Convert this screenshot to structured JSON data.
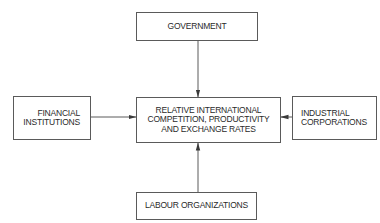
{
  "diagram": {
    "nodes": {
      "government": {
        "label": "GOVERNMENT"
      },
      "center": {
        "lines": [
          "RELATIVE INTERNATIONAL",
          "COMPETITION, PRODUCTIVITY",
          "AND EXCHANGE RATES"
        ]
      },
      "financial": {
        "lines": [
          "FINANCIAL",
          "INSTITUTIONS"
        ]
      },
      "industrial": {
        "lines": [
          "INDUSTRIAL",
          "CORPORATIONS"
        ]
      },
      "labour": {
        "label": "LABOUR ORGANIZATIONS"
      }
    },
    "edges": [
      {
        "from": "GOVERNMENT",
        "to": "RELATIVE INTERNATIONAL COMPETITION, PRODUCTIVITY AND EXCHANGE RATES"
      },
      {
        "from": "FINANCIAL INSTITUTIONS",
        "to": "RELATIVE INTERNATIONAL COMPETITION, PRODUCTIVITY AND EXCHANGE RATES"
      },
      {
        "from": "INDUSTRIAL CORPORATIONS",
        "to": "RELATIVE INTERNATIONAL COMPETITION, PRODUCTIVITY AND EXCHANGE RATES"
      },
      {
        "from": "LABOUR ORGANIZATIONS",
        "to": "RELATIVE INTERNATIONAL COMPETITION, PRODUCTIVITY AND EXCHANGE RATES"
      }
    ],
    "colors": {
      "line": "#5a5a5a",
      "text": "#2a2a2a",
      "background": "#ffffff"
    }
  }
}
